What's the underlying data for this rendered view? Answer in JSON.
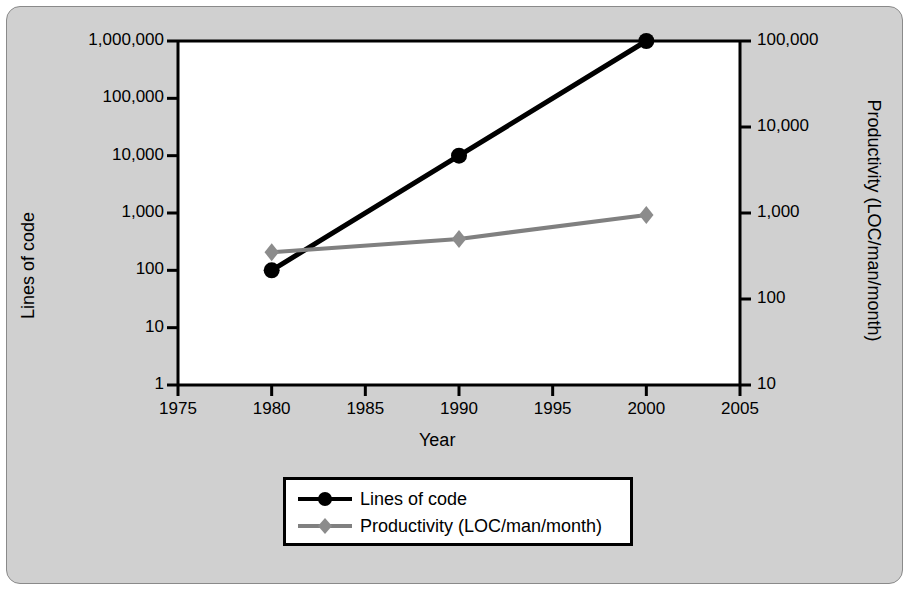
{
  "chart_data": {
    "type": "line",
    "title": "",
    "xlabel": "Year",
    "ylabel": "Lines of code",
    "ylabel_right": "Productivity (LOC/man/month)",
    "x": [
      1980,
      1990,
      2000
    ],
    "xlim": [
      1975,
      2005
    ],
    "xticks": [
      "1975",
      "1980",
      "1985",
      "1990",
      "1995",
      "2000",
      "2005"
    ],
    "xtick_values": [
      1975,
      1980,
      1985,
      1990,
      1995,
      2000,
      2005
    ],
    "yscale": "log",
    "ylim": [
      1,
      1000000
    ],
    "yticks": [
      "1,000,000",
      "100,000",
      "10,000",
      "1,000",
      "100",
      "10",
      "1"
    ],
    "ytick_values": [
      1000000,
      100000,
      10000,
      1000,
      100,
      10,
      1
    ],
    "yscale_right": "log",
    "ylim_right": [
      10,
      100000
    ],
    "yticks_right": [
      "100,000",
      "10,000",
      "1,000",
      "100",
      "10"
    ],
    "ytick_values_right": [
      100000,
      10000,
      1000,
      100,
      10
    ],
    "grid": false,
    "legend_position": "below-axes",
    "series": [
      {
        "name": "Lines of code",
        "axis": "left",
        "color": "#000000",
        "marker": "circle",
        "x": [
          1980,
          1990,
          2000
        ],
        "values": [
          100,
          10000,
          1000000
        ]
      },
      {
        "name": "Productivity (LOC/man/month)",
        "axis": "right",
        "color": "#808080",
        "marker": "diamond",
        "x": [
          1980,
          1990,
          2000
        ],
        "values": [
          350,
          500,
          950
        ]
      }
    ]
  },
  "axes": {
    "left_title": "Lines of code",
    "right_title": "Productivity (LOC/man/month)",
    "x_title": "Year",
    "left_ticks": [
      "1,000,000",
      "100,000",
      "10,000",
      "1,000",
      "100",
      "10",
      "1"
    ],
    "right_ticks": [
      "100,000",
      "10,000",
      "1,000",
      "100",
      "10"
    ],
    "x_ticks": [
      "1975",
      "1980",
      "1985",
      "1990",
      "1995",
      "2000",
      "2005"
    ]
  },
  "legend": {
    "items": [
      {
        "label": "Lines of code",
        "marker": "circle-marker",
        "color": "#000000"
      },
      {
        "label": "Productivity (LOC/man/month)",
        "marker": "diamond-marker",
        "color": "#808080"
      }
    ]
  },
  "colors": {
    "background": "#d0d0d0",
    "plot_background": "#ffffff",
    "axis": "#000000",
    "series_primary": "#000000",
    "series_secondary": "#808080"
  }
}
